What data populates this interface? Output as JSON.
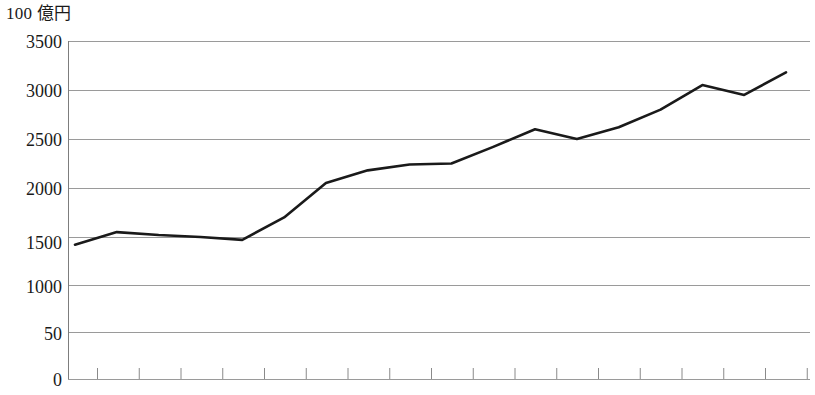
{
  "chart_data": {
    "type": "line",
    "title": "100 億円",
    "xlabel": "",
    "ylabel": "100 億円",
    "ylim": [
      0,
      3500
    ],
    "grid": true,
    "legend": false,
    "ytick_labels": [
      "3500",
      "3000",
      "2500",
      "2000",
      "1500",
      "1000",
      "50",
      "0"
    ],
    "ytick_values": [
      3500,
      3000,
      2500,
      2000,
      1500,
      1000,
      500,
      0
    ],
    "xtick_labels": [],
    "xtick_count": 18,
    "line_color": "#1a1a1a",
    "grid_color": "#9a9a9a",
    "x": [
      1,
      2,
      3,
      4,
      5,
      6,
      7,
      8,
      9,
      10,
      11,
      12,
      13,
      14,
      15,
      16,
      17,
      18
    ],
    "values": [
      1420,
      1550,
      1520,
      1500,
      1470,
      1700,
      2050,
      2180,
      2240,
      2250,
      2420,
      2600,
      2500,
      2620,
      2800,
      3050,
      2950,
      3180
    ],
    "series": [
      {
        "name": "100 億円",
        "values": [
          1420,
          1550,
          1520,
          1500,
          1470,
          1700,
          2050,
          2180,
          2240,
          2250,
          2420,
          2600,
          2500,
          2620,
          2800,
          3050,
          2950,
          3180
        ]
      }
    ],
    "annotations": []
  },
  "axis": {
    "unit_label": "100 億円",
    "ytick_0": "3500",
    "ytick_1": "3000",
    "ytick_2": "2500",
    "ytick_3": "2000",
    "ytick_4": "1500",
    "ytick_5": "1000",
    "ytick_6": "50",
    "ytick_7": "0"
  }
}
